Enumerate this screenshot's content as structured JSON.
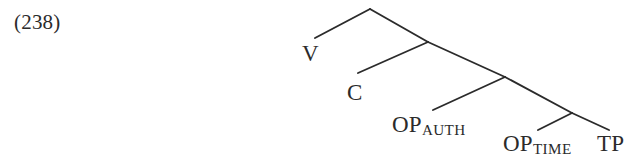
{
  "figure": {
    "example_number": "(238)",
    "background_color": "#ffffff",
    "line_color": "#2b2b2b",
    "text_color": "#2b2b2b"
  },
  "tree": {
    "nodes": [
      {
        "id": "v",
        "text": "V",
        "subscript": ""
      },
      {
        "id": "c",
        "text": "C",
        "subscript": ""
      },
      {
        "id": "op_auth",
        "text": "OP",
        "subscript": "AUTH"
      },
      {
        "id": "op_time",
        "text": "OP",
        "subscript": "TIME"
      },
      {
        "id": "tp",
        "text": "TP",
        "subscript": ""
      }
    ],
    "branch_points": [
      {
        "id": "root",
        "x": 370,
        "y": 9
      },
      {
        "id": "node2",
        "x": 428,
        "y": 42
      },
      {
        "id": "node3",
        "x": 505,
        "y": 77
      },
      {
        "id": "node4",
        "x": 572,
        "y": 113
      }
    ],
    "edges": [
      {
        "from": "root",
        "to": "v",
        "x1": 370,
        "y1": 9,
        "x2": 315,
        "y2": 38
      },
      {
        "from": "root",
        "to": "node2",
        "x1": 370,
        "y1": 9,
        "x2": 428,
        "y2": 42
      },
      {
        "from": "node2",
        "to": "c",
        "x1": 428,
        "y1": 42,
        "x2": 358,
        "y2": 73
      },
      {
        "from": "node2",
        "to": "node3",
        "x1": 428,
        "y1": 42,
        "x2": 505,
        "y2": 77
      },
      {
        "from": "node3",
        "to": "op_auth",
        "x1": 505,
        "y1": 77,
        "x2": 433,
        "y2": 110
      },
      {
        "from": "node3",
        "to": "node4",
        "x1": 505,
        "y1": 77,
        "x2": 572,
        "y2": 113
      },
      {
        "from": "node4",
        "to": "op_time",
        "x1": 572,
        "y1": 113,
        "x2": 538,
        "y2": 130
      },
      {
        "from": "node4",
        "to": "tp",
        "x1": 572,
        "y1": 113,
        "x2": 609,
        "y2": 130
      }
    ]
  }
}
